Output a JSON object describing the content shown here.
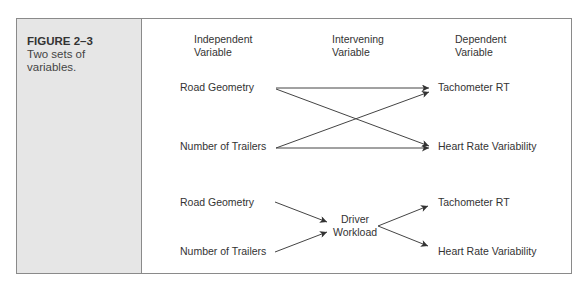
{
  "figure": {
    "number": "FIGURE 2–3",
    "caption_line1": "Two sets of",
    "caption_line2": "variables."
  },
  "headers": {
    "independent_line1": "Independent",
    "independent_line2": "Variable",
    "intervening_line1": "Intervening",
    "intervening_line2": "Variable",
    "dependent_line1": "Dependent",
    "dependent_line2": "Variable"
  },
  "top_model": {
    "independent": [
      "Road Geometry",
      "Number of Trailers"
    ],
    "dependent": [
      "Tachometer RT",
      "Heart Rate Variability"
    ],
    "links": [
      {
        "from": "Road Geometry",
        "to": "Tachometer RT"
      },
      {
        "from": "Road Geometry",
        "to": "Heart Rate Variability"
      },
      {
        "from": "Number of Trailers",
        "to": "Tachometer RT"
      },
      {
        "from": "Number of Trailers",
        "to": "Heart Rate Variability"
      }
    ]
  },
  "bottom_model": {
    "independent": [
      "Road Geometry",
      "Number of Trailers"
    ],
    "intervening_line1": "Driver",
    "intervening_line2": "Workload",
    "dependent": [
      "Tachometer RT",
      "Heart Rate Variability"
    ],
    "links": [
      {
        "from": "Road Geometry",
        "to": "Driver Workload"
      },
      {
        "from": "Number of Trailers",
        "to": "Driver Workload"
      },
      {
        "from": "Driver Workload",
        "to": "Tachometer RT"
      },
      {
        "from": "Driver Workload",
        "to": "Heart Rate Variability"
      }
    ]
  },
  "colors": {
    "panel": "#e6e6e6",
    "border": "#8a8a8a",
    "arrow": "#333333"
  }
}
